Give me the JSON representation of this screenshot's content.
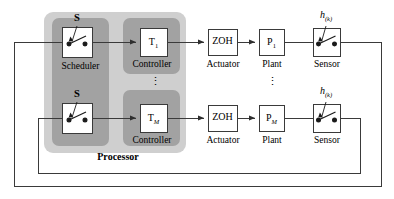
{
  "diagram": {
    "colors": {
      "processor_fill": "#cfcfcf",
      "block_fill": "#a6a6a6",
      "box_fill": "#ffffff",
      "line": "#3a3a3a",
      "text": "#000000"
    }
  },
  "processor": {
    "label": "Processor"
  },
  "scheduler": {
    "label": "Scheduler",
    "switches": [
      {
        "label": "S"
      },
      {
        "label": "S"
      }
    ]
  },
  "controllers": [
    {
      "box_label": "T",
      "box_sub": "1",
      "caption": "Controller"
    },
    {
      "box_label": "T",
      "box_sub": "M",
      "caption": "Controller"
    }
  ],
  "actuators": [
    {
      "box_label": "ZOH",
      "caption": "Actuator"
    },
    {
      "box_label": "ZOH",
      "caption": "Actuator"
    }
  ],
  "plants": [
    {
      "box_label": "P",
      "box_sub": "1",
      "caption": "Plant"
    },
    {
      "box_label": "P",
      "box_sub": "M",
      "caption": "Plant"
    }
  ],
  "sensors": [
    {
      "caption": "Sensor",
      "trigger_label": "h",
      "trigger_sub": "(k)"
    },
    {
      "caption": "Sensor",
      "trigger_label": "h",
      "trigger_sub": "(k)"
    }
  ],
  "ellipses": {
    "controller_column": "⋮",
    "plant_column": "⋮"
  }
}
